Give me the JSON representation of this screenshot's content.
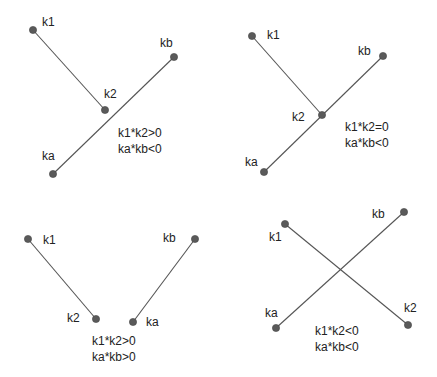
{
  "panels": [
    {
      "name": "panel-no-intersection-k-same-side",
      "segments": [
        {
          "from": "k1",
          "to": "k2"
        },
        {
          "from": "ka",
          "to": "kb"
        }
      ],
      "points": {
        "k1": {
          "x": 33,
          "y": 30,
          "label": "k1",
          "lx": 42,
          "ly": 26
        },
        "k2": {
          "x": 105,
          "y": 110,
          "label": "k2",
          "lx": 104,
          "ly": 98
        },
        "kb": {
          "x": 174,
          "y": 57,
          "label": "kb",
          "lx": 160,
          "ly": 47
        },
        "ka": {
          "x": 53,
          "y": 174,
          "label": "ka",
          "lx": 42,
          "ly": 160
        }
      },
      "conditions": [
        "k1*k2>0",
        "ka*kb<0"
      ],
      "cond_x": 118,
      "cond_y": 137
    },
    {
      "name": "panel-touching-endpoint",
      "segments": [
        {
          "from": "k1",
          "to": "k2"
        },
        {
          "from": "ka",
          "to": "kb"
        }
      ],
      "points": {
        "k1": {
          "x": 252,
          "y": 36,
          "label": "k1",
          "lx": 267,
          "ly": 39
        },
        "k2": {
          "x": 322,
          "y": 115,
          "label": "k2",
          "lx": 292,
          "ly": 121
        },
        "kb": {
          "x": 383,
          "y": 56,
          "label": "kb",
          "lx": 358,
          "ly": 55
        },
        "ka": {
          "x": 264,
          "y": 172,
          "label": "ka",
          "lx": 245,
          "ly": 166
        }
      },
      "conditions": [
        "k1*k2=0",
        "ka*kb<0"
      ],
      "cond_x": 345,
      "cond_y": 131
    },
    {
      "name": "panel-no-intersection-both-same-side",
      "segments": [
        {
          "from": "k1",
          "to": "k2"
        },
        {
          "from": "ka",
          "to": "kb"
        }
      ],
      "points": {
        "k1": {
          "x": 28,
          "y": 239,
          "label": "k1",
          "lx": 43,
          "ly": 244
        },
        "k2": {
          "x": 96,
          "y": 319,
          "label": "k2",
          "lx": 67,
          "ly": 322
        },
        "kb": {
          "x": 195,
          "y": 239,
          "label": "kb",
          "lx": 163,
          "ly": 242
        },
        "ka": {
          "x": 133,
          "y": 322,
          "label": "ka",
          "lx": 146,
          "ly": 326
        }
      },
      "conditions": [
        "k1*k2>0",
        "ka*kb>0"
      ],
      "cond_x": 92,
      "cond_y": 345
    },
    {
      "name": "panel-intersecting",
      "segments": [
        {
          "from": "k1",
          "to": "k2"
        },
        {
          "from": "ka",
          "to": "kb"
        }
      ],
      "points": {
        "k1": {
          "x": 285,
          "y": 224,
          "label": "k1",
          "lx": 269,
          "ly": 241
        },
        "kb": {
          "x": 404,
          "y": 212,
          "label": "kb",
          "lx": 372,
          "ly": 218
        },
        "ka": {
          "x": 276,
          "y": 328,
          "label": "ka",
          "lx": 265,
          "ly": 317
        },
        "k2": {
          "x": 408,
          "y": 325,
          "label": "k2",
          "lx": 404,
          "ly": 312
        }
      },
      "conditions": [
        "k1*k2<0",
        "ka*kb<0"
      ],
      "cond_x": 315,
      "cond_y": 335
    }
  ],
  "style": {
    "line_color": "#555555",
    "point_color": "#5a5a5a",
    "text_color": "#222222"
  }
}
